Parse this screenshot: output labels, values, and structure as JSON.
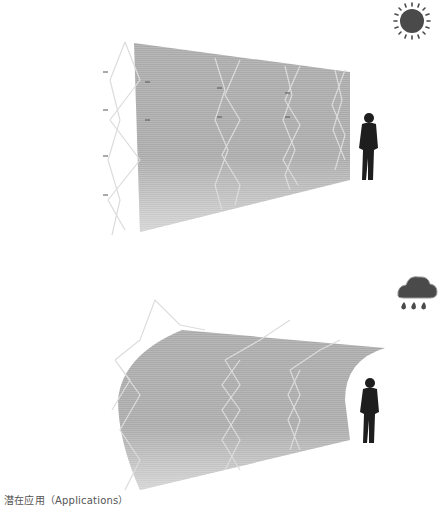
{
  "caption": "潜在应用（Applications）",
  "panels": [
    {
      "id": "top",
      "weather_icon": "sun-icon",
      "state": "flat-wall"
    },
    {
      "id": "bottom",
      "weather_icon": "rain-cloud-icon",
      "state": "curved-canopy"
    }
  ],
  "colors": {
    "membrane": "#b3b3b3",
    "frame": "#d9d9d9",
    "icon": "#4a4a4a",
    "figure": "#1e1e1e"
  }
}
